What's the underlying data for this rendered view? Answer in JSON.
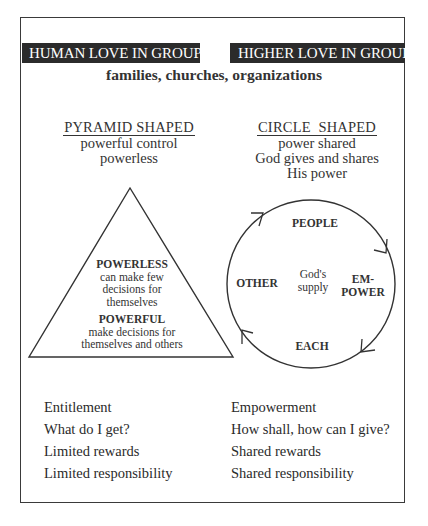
{
  "header": {
    "left_bar": "HUMAN LOVE IN GROUPS",
    "right_bar": "HIGHER LOVE IN GROUPS",
    "subtitle": "families, churches, organizations"
  },
  "left_column": {
    "title": "PYRAMID SHAPED",
    "lines": [
      "powerful control",
      "powerless"
    ],
    "pyramid": {
      "top_label": "POWERLESS",
      "top_text": [
        "can make few",
        "decisions for",
        "themselves"
      ],
      "bottom_label": "POWERFUL",
      "bottom_text": [
        "make decisions for",
        "themselves and others"
      ]
    },
    "list": [
      "Entitlement",
      "What do I get?",
      "Limited rewards",
      "Limited responsibility"
    ]
  },
  "right_column": {
    "title": "CIRCLE  SHAPED",
    "lines": [
      "power shared",
      "God gives and shares",
      "His power"
    ],
    "circle": {
      "top": "PEOPLE",
      "right": [
        "EM-",
        "POWER"
      ],
      "bottom": "EACH",
      "left": "OTHER",
      "center": [
        "God's",
        "supply"
      ]
    },
    "list": [
      "Empowerment",
      "How shall, how can I give?",
      "Shared rewards",
      "Shared responsibility"
    ]
  },
  "colors": {
    "bar_background": "#2b2b2b",
    "bar_text": "#ffffff",
    "ink": "#2a2a2a",
    "background": "#ffffff"
  }
}
